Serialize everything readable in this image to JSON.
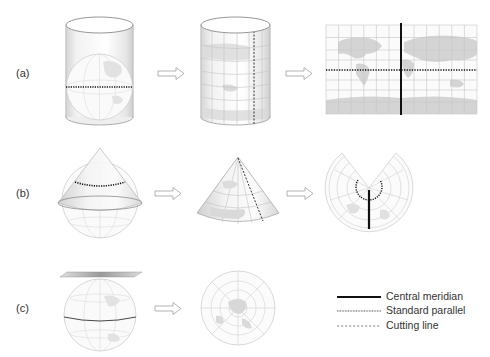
{
  "diagram": {
    "rows": [
      {
        "id": "a",
        "label": "(a)",
        "type": "cylindrical",
        "steps": [
          "globe-in-cylinder",
          "unrolled-cylinder",
          "flat-map"
        ]
      },
      {
        "id": "b",
        "label": "(b)",
        "type": "conic",
        "steps": [
          "globe-with-cone",
          "cone",
          "flattened-fan"
        ]
      },
      {
        "id": "c",
        "label": "(c)",
        "type": "azimuthal",
        "steps": [
          "globe-with-plane",
          "polar-disk"
        ]
      }
    ],
    "arrow_icon": "outline-right-arrow"
  },
  "legend": {
    "items": [
      {
        "label": "Central meridian",
        "style": "solid-thick"
      },
      {
        "label": "Standard parallel",
        "style": "dotted"
      },
      {
        "label": "Cutting line",
        "style": "dashed"
      }
    ]
  },
  "colors": {
    "land": "#d4d4d4",
    "grid": "#c8c8c8",
    "outline": "#9a9a9a",
    "line": "#111111",
    "text": "#333333"
  }
}
